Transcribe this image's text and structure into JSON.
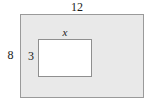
{
  "figure": {
    "kind": "geometry-diagram",
    "outer_rectangle": {
      "name": "outer-rectangle",
      "width_label": "12",
      "height_label": "8",
      "fill_color": "#e9e9e9",
      "border_color": "#9a9a9a"
    },
    "inner_rectangle": {
      "name": "inner-rectangle",
      "width_label": "x",
      "height_label": "3",
      "fill_color": "#ffffff",
      "border_color": "#8f8f8f"
    }
  },
  "chart_data": {
    "type": "diagram",
    "title": "",
    "shapes": [
      {
        "shape": "rectangle",
        "role": "outer",
        "width": 12,
        "height": 8,
        "width_label": "12",
        "height_label": "8",
        "fill": "#e9e9e9",
        "stroke": "#9a9a9a"
      },
      {
        "shape": "rectangle",
        "role": "inner",
        "width": "x",
        "height": 3,
        "width_label": "x",
        "height_label": "3",
        "fill": "#ffffff",
        "stroke": "#8f8f8f"
      }
    ],
    "annotations": [
      "12",
      "8",
      "x",
      "3"
    ]
  }
}
